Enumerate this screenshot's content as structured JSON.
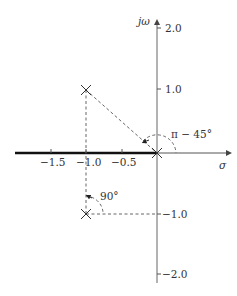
{
  "diagram": {
    "type": "s-plane pole-zero plot",
    "axes": {
      "x_label": "σ",
      "y_label": "jω",
      "x_ticks": [
        "−1.5",
        "−1.0",
        "−0.5"
      ],
      "y_ticks": [
        "2.0",
        "1.0",
        "−1.0",
        "−2.0"
      ]
    },
    "poles": [
      {
        "re": -1.0,
        "im": 1.0
      },
      {
        "re": -1.0,
        "im": -1.0
      },
      {
        "re": 0.0,
        "im": 0.0
      }
    ],
    "angles": {
      "upper": "π − 45°",
      "lower": "90°"
    },
    "root_locus_segment": {
      "from": -1.75,
      "to": 0.0
    }
  }
}
